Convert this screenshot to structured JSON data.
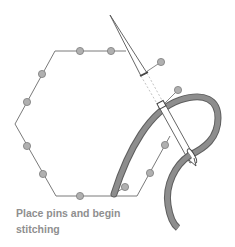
{
  "figure": {
    "caption_line1": "Place pins and begin",
    "caption_line2": "stitching",
    "colors": {
      "outline": "#6f6f6f",
      "pin_head": "#aaaaaa",
      "pin_head_stroke": "#777777",
      "thread": "#8a8a8a",
      "thread_edge": "#5e5e5e",
      "caption": "#8f8f8f"
    },
    "elements": [
      "hexagon-template",
      "pins",
      "needle",
      "thread"
    ]
  }
}
